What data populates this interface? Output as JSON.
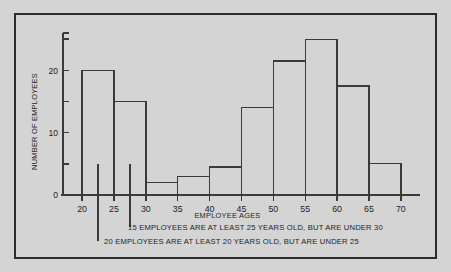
{
  "chart_data": {
    "type": "bar",
    "title": "",
    "xlabel": "EMPLOYEE AGES",
    "ylabel": "NUMBER OF EMPLOYEES",
    "xlim": [
      17,
      73
    ],
    "ylim": [
      0,
      26
    ],
    "grid": false,
    "legend": "none",
    "bin_width": 5,
    "categories": [
      "20-25",
      "25-30",
      "30-35",
      "35-40",
      "40-45",
      "45-50",
      "50-55",
      "55-60",
      "60-65",
      "65-70"
    ],
    "bin_edges": [
      20,
      25,
      30,
      35,
      40,
      45,
      50,
      55,
      60,
      65,
      70
    ],
    "values": [
      20,
      15,
      2,
      3,
      4.5,
      14,
      21.5,
      25,
      17.5,
      5
    ],
    "xticks": [
      20,
      25,
      30,
      35,
      40,
      45,
      50,
      55,
      60,
      65,
      70
    ],
    "xtick_labels": [
      "20",
      "25",
      "30",
      "35",
      "40",
      "45",
      "50",
      "55",
      "60",
      "65",
      "70"
    ],
    "yticks": [
      0,
      5,
      10,
      15,
      20,
      25
    ],
    "ytick_labels": [
      "0",
      "",
      "10",
      "",
      "20",
      ""
    ],
    "annotations": [
      {
        "text": "15 EMPLOYEES ARE AT LEAST 25 YEARS OLD, BUT ARE UNDER 30",
        "points_to_bin": "25-30",
        "leader_x": 27.5
      },
      {
        "text": "20 EMPLOYEES ARE AT LEAST 20 YEARS OLD, BUT ARE UNDER 25",
        "points_to_bin": "20-25",
        "leader_x": 22.5
      }
    ],
    "colors": {
      "background": "#d4d4d4",
      "line": "#3a3a3a",
      "axis": "#1d1d1d",
      "border": "#2b2b2b"
    }
  }
}
